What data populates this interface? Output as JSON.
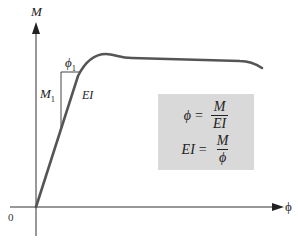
{
  "diagram": {
    "y_axis_label": "M",
    "x_axis_label": "ϕ",
    "origin_label": "0",
    "triangle": {
      "horizontal_label": "ϕ",
      "horizontal_sub": "1",
      "vertical_label": "M",
      "vertical_sub": "1",
      "slope_label": "EI"
    },
    "curve_color": "#555555",
    "formula_box": {
      "background": "#d9d9d9",
      "formula1": {
        "lhs": "ϕ",
        "eq": "=",
        "num": "M",
        "den": "EI"
      },
      "formula2": {
        "lhs": "EI",
        "eq": "=",
        "num": "M",
        "den": "ϕ"
      }
    }
  }
}
